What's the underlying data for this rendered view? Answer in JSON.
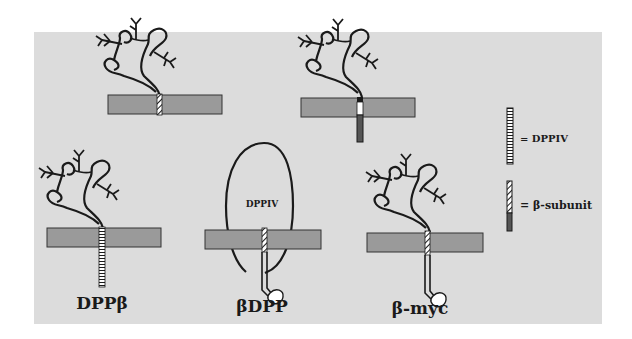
{
  "diagram": {
    "constructs": [
      {
        "id": "construct-top-left",
        "label": "",
        "tm_type": "beta-subunit",
        "extracellular": "beta-subunit-ectodomain",
        "cytoplasmic_tail": "none"
      },
      {
        "id": "construct-top-right",
        "label": "",
        "tm_type": "dppiv-beta-junction",
        "extracellular": "beta-subunit-ectodomain",
        "cytoplasmic_tail": "dppiv"
      },
      {
        "id": "construct-dpp-beta",
        "label": "DPPβ",
        "tm_type": "dppiv",
        "extracellular": "beta-subunit-ectodomain",
        "cytoplasmic_tail": "dppiv"
      },
      {
        "id": "construct-beta-dpp",
        "label": "βDPP",
        "tm_type": "beta-subunit",
        "extracellular": "DPPIV",
        "cytoplasmic_tail": "beta-subunit-with-myc-tag"
      },
      {
        "id": "construct-beta-myc",
        "label": "β-myc",
        "tm_type": "beta-subunit",
        "extracellular": "beta-subunit-ectodomain",
        "cytoplasmic_tail": "beta-subunit-with-myc-tag"
      }
    ],
    "ectodomain_label": "DPPIV",
    "legend": [
      {
        "icon": "dppiv-segment-icon",
        "text": "= DPPIV"
      },
      {
        "icon": "beta-subunit-segment-icon",
        "text": "= β-subunit"
      }
    ],
    "colors": {
      "panel_bg": "#dcdcdc",
      "membrane": "#9a9a9a",
      "ink": "#1a1a1a"
    }
  }
}
